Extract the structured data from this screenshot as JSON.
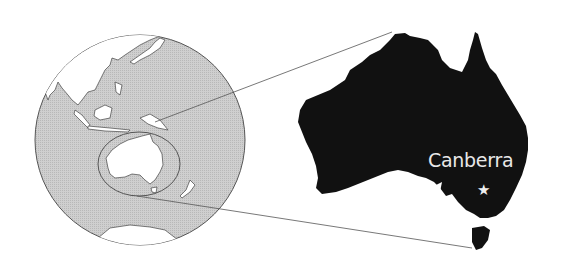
{
  "map": {
    "globe": {
      "center": [
        140,
        140
      ],
      "radius": 105,
      "ocean_color": "#c8c8c8",
      "land_color": "#ffffff",
      "outline_color": "#555555"
    },
    "highlight_region": "Australia",
    "inset": {
      "land_color": "#111111"
    },
    "city_label": "Canberra",
    "city_marker": "star-icon",
    "marker_symbol": "★"
  }
}
